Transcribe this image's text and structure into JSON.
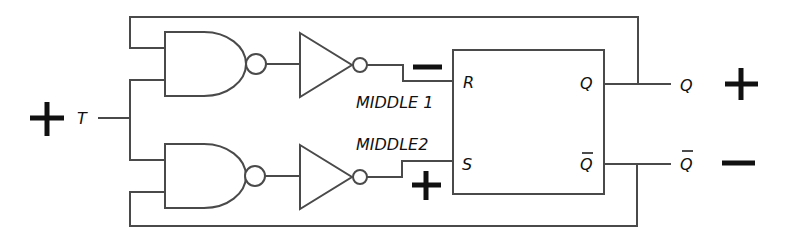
{
  "diagram": {
    "colors": {
      "wire": "#4a4a4a",
      "text": "#111111",
      "background": "#ffffff"
    },
    "input": {
      "label": "T",
      "polarity": "+"
    },
    "signals": {
      "middle1": {
        "label": "MIDDLE 1",
        "polarity": "−"
      },
      "middle2": {
        "label": "MIDDLE2",
        "polarity": "+"
      }
    },
    "flipflop": {
      "inputs": {
        "r": "R",
        "s": "S"
      },
      "outputs": {
        "q": "Q",
        "qbar": "Q"
      }
    },
    "outputs": {
      "q": {
        "label": "Q",
        "polarity": "+"
      },
      "qbar": {
        "label": "Q",
        "polarity": "−"
      }
    },
    "gates": [
      {
        "type": "NAND",
        "name": "nand-top"
      },
      {
        "type": "NOT",
        "name": "inverter-top"
      },
      {
        "type": "NAND",
        "name": "nand-bottom"
      },
      {
        "type": "NOT",
        "name": "inverter-bottom"
      }
    ]
  }
}
